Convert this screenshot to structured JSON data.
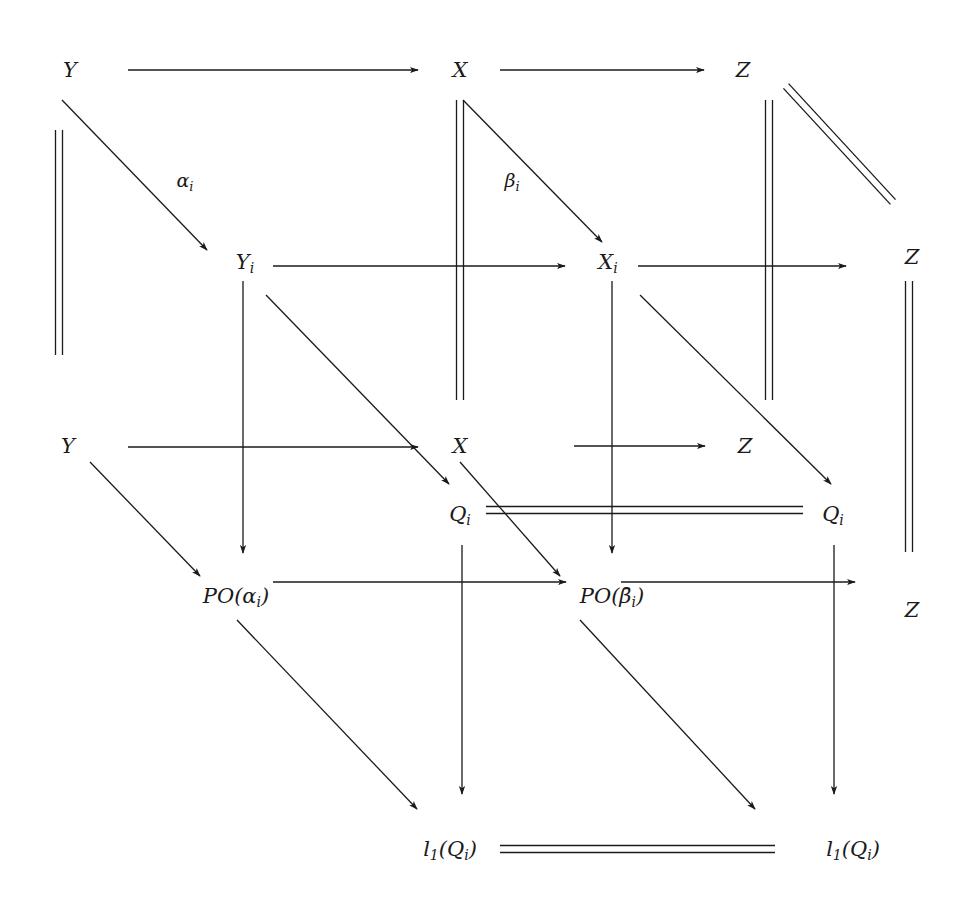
{
  "diagram": {
    "type": "commutative-diagram",
    "nodes": [
      {
        "id": "Y_top",
        "base": "Y",
        "sub": "",
        "x": 70,
        "y": 70
      },
      {
        "id": "X_top",
        "base": "X",
        "sub": "",
        "x": 460,
        "y": 70
      },
      {
        "id": "Z_top",
        "base": "Z",
        "sub": "",
        "x": 743,
        "y": 70
      },
      {
        "id": "Y_i",
        "base": "Y",
        "sub": "i",
        "x": 245,
        "y": 263
      },
      {
        "id": "X_i",
        "base": "X",
        "sub": "i",
        "x": 608,
        "y": 263
      },
      {
        "id": "Z_midright",
        "base": "Z",
        "sub": "",
        "x": 912,
        "y": 257
      },
      {
        "id": "Y_mid",
        "base": "Y",
        "sub": "",
        "x": 68,
        "y": 446
      },
      {
        "id": "X_mid",
        "base": "X",
        "sub": "",
        "x": 460,
        "y": 446
      },
      {
        "id": "Z_mid",
        "base": "Z",
        "sub": "",
        "x": 745,
        "y": 446
      },
      {
        "id": "Q_i_left",
        "base": "Q",
        "sub": "i",
        "x": 460,
        "y": 515
      },
      {
        "id": "Q_i_right",
        "base": "Q",
        "sub": "i",
        "x": 833,
        "y": 515
      },
      {
        "id": "PO_alpha",
        "base": "PO(α",
        "sub": "i",
        "tail": ")",
        "x": 236,
        "y": 597
      },
      {
        "id": "PO_beta",
        "base": "PO(β̄",
        "sub": "i",
        "tail": ")",
        "x": 612,
        "y": 597
      },
      {
        "id": "Z_bottomright",
        "base": "Z",
        "sub": "",
        "x": 912,
        "y": 610
      },
      {
        "id": "l1_Q_left",
        "base": "l",
        "sub": "1",
        "tail": "(Q",
        "sub2": "i",
        "tail2": ")",
        "x": 450,
        "y": 850
      },
      {
        "id": "l1_Q_right",
        "base": "l",
        "sub": "1",
        "tail": "(Q",
        "sub2": "i",
        "tail2": ")",
        "x": 853,
        "y": 850
      }
    ],
    "edge_labels": [
      {
        "id": "alpha_i",
        "base": "α",
        "sub": "i",
        "x": 185,
        "y": 182
      },
      {
        "id": "beta_i",
        "base": "β",
        "sub": "i",
        "x": 512,
        "y": 182
      }
    ],
    "arrows": [
      {
        "from": "Y_top",
        "to": "X_top",
        "kind": "arrow",
        "x1": 128,
        "y1": 70,
        "x2": 418,
        "y2": 70
      },
      {
        "from": "X_top",
        "to": "Z_top",
        "kind": "arrow",
        "x1": 500,
        "y1": 70,
        "x2": 704,
        "y2": 70
      },
      {
        "from": "Y_top",
        "to": "Y_i",
        "kind": "arrow",
        "label": "alpha_i",
        "x1": 62,
        "y1": 100,
        "x2": 207,
        "y2": 250
      },
      {
        "from": "X_top",
        "to": "X_i",
        "kind": "arrow",
        "label": "beta_i",
        "x1": 463,
        "y1": 100,
        "x2": 602,
        "y2": 242
      },
      {
        "from": "Y_i",
        "to": "X_i",
        "kind": "arrow",
        "x1": 273,
        "y1": 266,
        "x2": 565,
        "y2": 266
      },
      {
        "from": "X_i",
        "to": "Z_midright",
        "kind": "arrow",
        "x1": 638,
        "y1": 266,
        "x2": 846,
        "y2": 266
      },
      {
        "from": "Y_mid",
        "to": "X_mid",
        "kind": "arrow",
        "x1": 128,
        "y1": 447,
        "x2": 418,
        "y2": 447
      },
      {
        "from": "X_mid",
        "to": "Z_mid",
        "kind": "arrow",
        "x1": 574,
        "y1": 446,
        "x2": 705,
        "y2": 446
      },
      {
        "from": "Y_i",
        "to": "PO_alpha",
        "kind": "arrow",
        "x1": 243,
        "y1": 281,
        "x2": 243,
        "y2": 553
      },
      {
        "from": "Y_i",
        "to": "Q_i_left",
        "kind": "arrow",
        "x1": 266,
        "y1": 295,
        "x2": 449,
        "y2": 484
      },
      {
        "from": "X_i",
        "to": "PO_beta",
        "kind": "arrow",
        "x1": 612,
        "y1": 281,
        "x2": 612,
        "y2": 553
      },
      {
        "from": "X_i",
        "to": "Q_i_right",
        "kind": "arrow",
        "x1": 640,
        "y1": 295,
        "x2": 831,
        "y2": 484
      },
      {
        "from": "Y_mid",
        "to": "PO_alpha",
        "kind": "arrow",
        "x1": 90,
        "y1": 462,
        "x2": 200,
        "y2": 576
      },
      {
        "from": "X_mid",
        "to": "PO_beta",
        "kind": "arrow",
        "x1": 460,
        "y1": 462,
        "x2": 560,
        "y2": 576
      },
      {
        "from": "PO_alpha",
        "to": "PO_beta",
        "kind": "arrow",
        "x1": 273,
        "y1": 582,
        "x2": 566,
        "y2": 582
      },
      {
        "from": "PO_beta",
        "to": "Z_bottomright",
        "kind": "arrow",
        "x1": 621,
        "y1": 582,
        "x2": 855,
        "y2": 582
      },
      {
        "from": "Q_i_left",
        "to": "l1_Q_left",
        "kind": "arrow",
        "x1": 462,
        "y1": 545,
        "x2": 462,
        "y2": 794
      },
      {
        "from": "Q_i_right",
        "to": "l1_Q_right",
        "kind": "arrow",
        "x1": 834,
        "y1": 545,
        "x2": 834,
        "y2": 794
      },
      {
        "from": "PO_alpha",
        "to": "l1_Q_left",
        "kind": "arrow",
        "x1": 237,
        "y1": 620,
        "x2": 417,
        "y2": 809
      },
      {
        "from": "PO_beta",
        "to": "l1_Q_right",
        "kind": "arrow",
        "x1": 580,
        "y1": 620,
        "x2": 755,
        "y2": 809
      }
    ],
    "equalities": [
      {
        "from": "Y_top",
        "to": "Y_mid",
        "orientation": "vertical",
        "x1": 59,
        "y1": 130,
        "x2": 59,
        "y2": 355
      },
      {
        "from": "X_top",
        "to": "X_mid",
        "orientation": "vertical",
        "x1": 460,
        "y1": 100,
        "x2": 460,
        "y2": 400
      },
      {
        "from": "Z_top",
        "to": "Z_mid",
        "orientation": "vertical",
        "x1": 769,
        "y1": 100,
        "x2": 769,
        "y2": 400
      },
      {
        "from": "Z_top",
        "to": "Z_midright",
        "orientation": "diagonal",
        "x1": 786,
        "y1": 86,
        "x2": 893,
        "y2": 202
      },
      {
        "from": "Z_midright",
        "to": "Z_bottomright",
        "orientation": "vertical",
        "x1": 909,
        "y1": 281,
        "x2": 909,
        "y2": 552
      },
      {
        "from": "Q_i_left",
        "to": "Q_i_right",
        "orientation": "horizontal",
        "x1": 486,
        "y1": 510,
        "x2": 803,
        "y2": 510
      },
      {
        "from": "l1_Q_left",
        "to": "l1_Q_right",
        "orientation": "horizontal",
        "x1": 500,
        "y1": 849,
        "x2": 775,
        "y2": 849
      }
    ]
  }
}
